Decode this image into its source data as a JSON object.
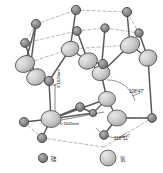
{
  "figure": {
    "kind": "crystal-structure-diagram",
    "background": "#ffffff",
    "palette": {
      "silicon_fill": "#8a8a8a",
      "silicon_stroke": "#3a3a3a",
      "oxygen_fill": "#c9c9c9",
      "oxygen_stroke": "#4a4a4a",
      "bond_stroke": "#555555",
      "dashed_stroke": "#9a9a9a",
      "text": "#1a1a1a"
    }
  },
  "annotations": {
    "bond_length_vertical": "0.1620nm",
    "bond_length_horizontal": "0.1645nm",
    "bond_angle_upper": "108°47'",
    "bond_angle_lower": "110°51'"
  },
  "legend": {
    "items": [
      {
        "marker": "small-dark-circle",
        "label": "硅"
      },
      {
        "marker": "large-light-circle",
        "label": "氧"
      }
    ]
  },
  "atoms": {
    "silicon": [
      {
        "id": "si1",
        "cx": 36,
        "cy": 24,
        "r": 4.6
      },
      {
        "id": "si2",
        "cx": 76,
        "cy": 10,
        "r": 4.6
      },
      {
        "id": "si3",
        "cx": 127,
        "cy": 12,
        "r": 4.6
      },
      {
        "id": "si4",
        "cx": 139,
        "cy": 33,
        "r": 4.2
      },
      {
        "id": "si5",
        "cx": 77,
        "cy": 31,
        "r": 4.4
      },
      {
        "id": "si6",
        "cx": 105,
        "cy": 28,
        "r": 4.2
      },
      {
        "id": "si7",
        "cx": 25,
        "cy": 43,
        "r": 4.4
      },
      {
        "id": "si8",
        "cx": 49,
        "cy": 81,
        "r": 4.6
      },
      {
        "id": "si9",
        "cx": 103,
        "cy": 64,
        "r": 4.6
      },
      {
        "id": "si10",
        "cx": 80,
        "cy": 107,
        "r": 4.4
      },
      {
        "id": "si11",
        "cx": 24,
        "cy": 122,
        "r": 4.6
      },
      {
        "id": "si12",
        "cx": 42,
        "cy": 138,
        "r": 4.6
      },
      {
        "id": "si13",
        "cx": 104,
        "cy": 135,
        "r": 4.4
      },
      {
        "id": "si14",
        "cx": 152,
        "cy": 118,
        "r": 4.4
      },
      {
        "id": "si15",
        "cx": 93,
        "cy": 113,
        "r": 3.6
      }
    ],
    "oxygen": [
      {
        "id": "o1",
        "cx": 25,
        "cy": 64,
        "rx": 10,
        "ry": 8,
        "rot": -28
      },
      {
        "id": "o2",
        "cx": 36,
        "cy": 77,
        "rx": 9.5,
        "ry": 8,
        "rot": -22
      },
      {
        "id": "o3",
        "cx": 70,
        "cy": 49,
        "rx": 9,
        "ry": 7.5,
        "rot": -20
      },
      {
        "id": "o4",
        "cx": 88,
        "cy": 61,
        "rx": 9.5,
        "ry": 8,
        "rot": -18
      },
      {
        "id": "o5",
        "cx": 101,
        "cy": 73,
        "rx": 9,
        "ry": 7.5,
        "rot": -15
      },
      {
        "id": "o6",
        "cx": 130,
        "cy": 45,
        "rx": 10,
        "ry": 8,
        "rot": -25
      },
      {
        "id": "o7",
        "cx": 148,
        "cy": 58,
        "rx": 9,
        "ry": 8,
        "rot": -25
      },
      {
        "id": "o8",
        "cx": 51,
        "cy": 119,
        "rx": 10,
        "ry": 8.5,
        "rot": 0
      },
      {
        "id": "o9",
        "cx": 107,
        "cy": 99,
        "rx": 8.5,
        "ry": 7.5,
        "rot": 0
      },
      {
        "id": "o10",
        "cx": 117,
        "cy": 118,
        "rx": 9.5,
        "ry": 8,
        "rot": 0
      }
    ]
  }
}
